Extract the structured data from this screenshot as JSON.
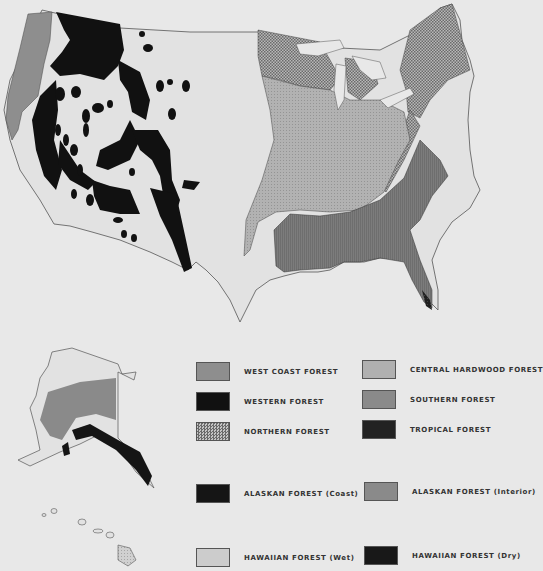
{
  "map": {
    "title": "Forest regions of the United States",
    "regions": [
      "Contiguous United States",
      "Alaska",
      "Hawaii"
    ]
  },
  "colors": {
    "background": "#e8e8e8",
    "west_coast": "#8e8e8e",
    "western": "#111111",
    "northern": "#9a9a9a",
    "central_hardwood": "#b0b0b0",
    "southern": "#7a7a7a",
    "tropical": "#222222",
    "alaskan_coast": "#151515",
    "alaskan_interior": "#8a8a8a",
    "hawaiian_wet": "#c4c4c4",
    "hawaiian_dry": "#181818"
  },
  "legend": {
    "items": [
      {
        "label": "WEST COAST FOREST",
        "swatch": "west_coast"
      },
      {
        "label": "WESTERN FOREST",
        "swatch": "western"
      },
      {
        "label": "NORTHERN FOREST",
        "swatch": "northern"
      },
      {
        "label": "CENTRAL HARDWOOD FOREST",
        "swatch": "central_hardwood"
      },
      {
        "label": "SOUTHERN FOREST",
        "swatch": "southern"
      },
      {
        "label": "TROPICAL FOREST",
        "swatch": "tropical"
      },
      {
        "label": "ALASKAN FOREST (Coast)",
        "swatch": "alaskan_coast"
      },
      {
        "label": "ALASKAN FOREST (Interior)",
        "swatch": "alaskan_interior"
      },
      {
        "label": "HAWAIIAN FOREST (Wet)",
        "swatch": "hawaiian_wet"
      },
      {
        "label": "HAWAIIAN FOREST (Dry)",
        "swatch": "hawaiian_dry"
      }
    ]
  }
}
